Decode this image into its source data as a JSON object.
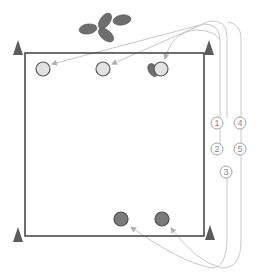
{
  "diagram": {
    "type": "sports-drill",
    "field": {
      "x": 25,
      "y": 53,
      "width": 179,
      "height": 183,
      "stroke": "#4a4a4a"
    },
    "cones": [
      {
        "id": "cone-top-left",
        "x": 18,
        "y": 48
      },
      {
        "id": "cone-top-right",
        "x": 209,
        "y": 48
      },
      {
        "id": "cone-bottom-left",
        "x": 18,
        "y": 236
      },
      {
        "id": "cone-bottom-right",
        "x": 210,
        "y": 236
      }
    ],
    "footballs_pile": {
      "x": 105,
      "y": 22,
      "count": 4,
      "color": "#6e6e6e"
    },
    "players_light": [
      {
        "id": "player-light-1",
        "x": 43,
        "y": 69
      },
      {
        "id": "player-light-2",
        "x": 103,
        "y": 69
      },
      {
        "id": "player-light-3",
        "x": 161,
        "y": 69,
        "holding_ball": true
      }
    ],
    "players_dark": [
      {
        "id": "player-dark-1",
        "x": 121,
        "y": 219
      },
      {
        "id": "player-dark-2",
        "x": 162,
        "y": 219
      }
    ],
    "sequence_labels": [
      {
        "label": "1",
        "x": 217,
        "y": 123
      },
      {
        "label": "4",
        "x": 240,
        "y": 123
      },
      {
        "label": "2",
        "x": 217,
        "y": 149
      },
      {
        "label": "5",
        "x": 240,
        "y": 149
      },
      {
        "label": "3",
        "x": 226,
        "y": 172
      }
    ],
    "colors": {
      "cone": "#5c5c5c",
      "light_player_fill": "#e2e2e2",
      "light_player_stroke": "#5a5a5a",
      "dark_player_fill": "#7a7a7a",
      "dark_player_stroke": "#4e4e4e",
      "path_line": "#c8c8c8",
      "arrowhead": "#b0b0b0"
    }
  }
}
